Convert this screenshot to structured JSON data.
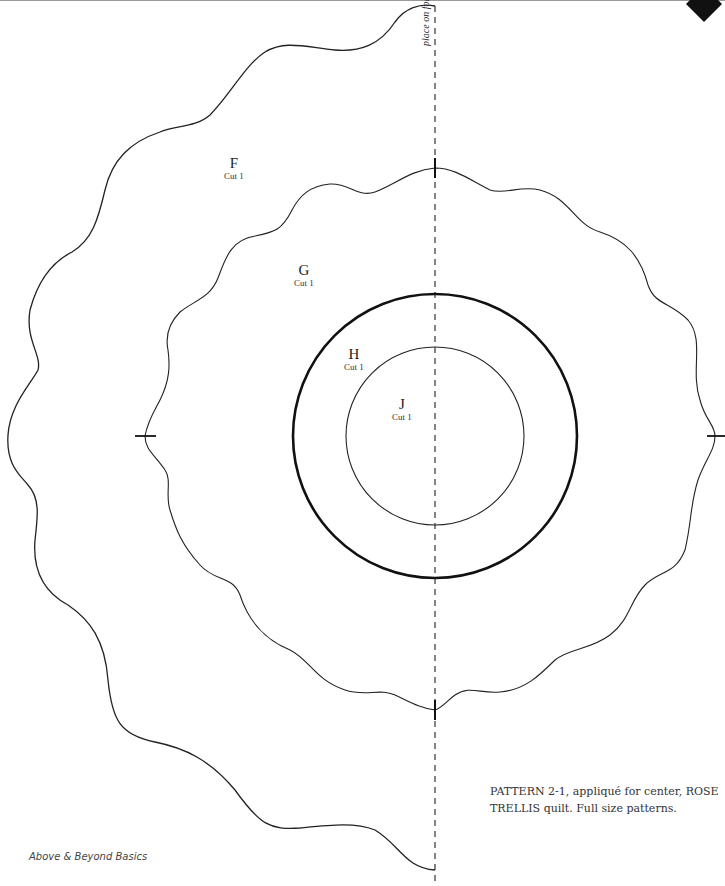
{
  "page": {
    "page_number": "89",
    "fold_label": "place on fold",
    "caption": "PATTERN 2-1, appliqué for center, ROSE TRELLIS quilt. Full size patterns.",
    "footer": "Above & Beyond Basics"
  },
  "pieces": [
    {
      "id": "F",
      "letter": "F",
      "instruction": "Cut 1"
    },
    {
      "id": "G",
      "letter": "G",
      "instruction": "Cut 1"
    },
    {
      "id": "H",
      "letter": "H",
      "instruction": "Cut 1"
    },
    {
      "id": "J",
      "letter": "J",
      "instruction": "Cut 1"
    }
  ],
  "colors": {
    "line": "#222222",
    "background": "#ffffff",
    "badge": "#111111"
  }
}
